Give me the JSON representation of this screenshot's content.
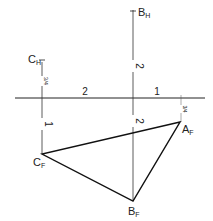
{
  "diagram": {
    "points": {
      "B_H": {
        "label": "B",
        "sub": "H",
        "x": 133,
        "y": 11
      },
      "C_H": {
        "label": "C",
        "sub": "H",
        "x": 42,
        "y": 60
      },
      "A_F": {
        "label": "A",
        "sub": "F",
        "x": 180,
        "y": 122
      },
      "C_F": {
        "label": "C",
        "sub": "F",
        "x": 42,
        "y": 154
      },
      "B_F": {
        "label": "B",
        "sub": "F",
        "x": 133,
        "y": 201
      }
    },
    "reference_line": {
      "y": 98,
      "x1": 15,
      "x2": 205
    },
    "dimensions": {
      "horiz_left": "2",
      "horiz_right": "1",
      "B_upper": "2",
      "B_lower": "2",
      "C_upper": "3/4",
      "C_lower": "1",
      "A_upper": "3/4"
    },
    "colors": {
      "line": "#222222",
      "background": "#ffffff"
    }
  }
}
